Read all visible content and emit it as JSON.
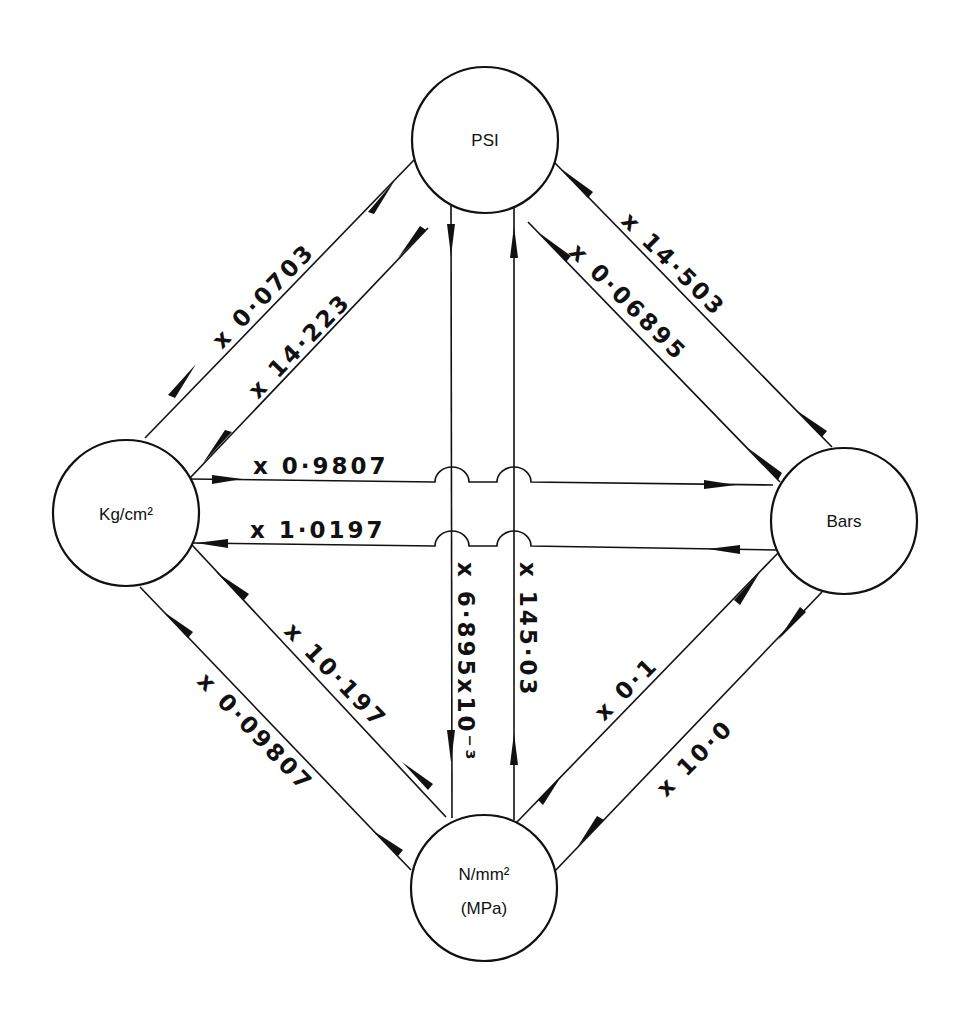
{
  "colors": {
    "ink": "#111111",
    "background": "#ffffff"
  },
  "nodes": {
    "psi": {
      "label": "PSI"
    },
    "kgcm2": {
      "label": "Kg/cm²"
    },
    "bars": {
      "label": "Bars"
    },
    "mpa": {
      "line1": "N/mm²",
      "line2": "(MPa)"
    }
  },
  "conversions": {
    "psi_to_kgcm2": {
      "from": "PSI",
      "to": "Kg/cm²",
      "factor": "x 0·0703"
    },
    "kgcm2_to_psi": {
      "from": "Kg/cm²",
      "to": "PSI",
      "factor": "x 14·223"
    },
    "bars_to_psi": {
      "from": "Bars",
      "to": "PSI",
      "factor": "x 14·503"
    },
    "psi_to_bars": {
      "from": "PSI",
      "to": "Bars",
      "factor": "x 0·06895"
    },
    "kgcm2_to_bars": {
      "from": "Kg/cm²",
      "to": "Bars",
      "factor": "x 0·9807"
    },
    "bars_to_kgcm2": {
      "from": "Bars",
      "to": "Kg/cm²",
      "factor": "x 1·0197"
    },
    "psi_to_mpa": {
      "from": "PSI",
      "to": "N/mm² (MPa)",
      "factor": "x 6·895x10⁻³"
    },
    "mpa_to_psi": {
      "from": "N/mm² (MPa)",
      "to": "PSI",
      "factor": "x 145·03"
    },
    "mpa_to_kgcm2": {
      "from": "N/mm² (MPa)",
      "to": "Kg/cm²",
      "factor": "x 10·197"
    },
    "kgcm2_to_mpa": {
      "from": "Kg/cm²",
      "to": "N/mm² (MPa)",
      "factor": "x 0·09807"
    },
    "bars_to_mpa": {
      "from": "Bars",
      "to": "N/mm² (MPa)",
      "factor": "x 0·1"
    },
    "mpa_to_bars": {
      "from": "N/mm² (MPa)",
      "to": "Bars",
      "factor": "x 10·0"
    }
  }
}
